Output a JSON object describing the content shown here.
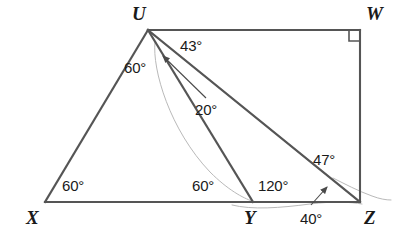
{
  "figure": {
    "kind": "geometry-diagram",
    "stroke_color": "#555555",
    "faint_stroke_color": "#b9b9b9",
    "leader_color": "#4a4a4a",
    "text_color": "#1a1a1a",
    "background": "#ffffff",
    "width": 405,
    "height": 235
  },
  "vertices": [
    {
      "id": "U",
      "label": "U",
      "x": 148,
      "y": 30,
      "label_x": 132,
      "label_y": 4
    },
    {
      "id": "W",
      "label": "W",
      "x": 360,
      "y": 30,
      "label_x": 366,
      "label_y": 4
    },
    {
      "id": "X",
      "label": "X",
      "x": 45,
      "y": 202,
      "label_x": 26,
      "label_y": 208
    },
    {
      "id": "Y",
      "label": "Y",
      "x": 253,
      "y": 202,
      "label_x": 244,
      "label_y": 208
    },
    {
      "id": "Z",
      "label": "Z",
      "x": 360,
      "y": 202,
      "label_x": 364,
      "label_y": 208
    }
  ],
  "segments": [
    {
      "name": "segment-UW",
      "from": "U",
      "to": "W",
      "x1": 148,
      "y1": 30,
      "x2": 360,
      "y2": 30
    },
    {
      "name": "segment-WZ",
      "from": "W",
      "to": "Z",
      "x1": 360,
      "y1": 30,
      "x2": 360,
      "y2": 202
    },
    {
      "name": "segment-XZ",
      "from": "X",
      "to": "Z",
      "x1": 45,
      "y1": 202,
      "x2": 360,
      "y2": 202
    },
    {
      "name": "segment-UX",
      "from": "U",
      "to": "X",
      "x1": 148,
      "y1": 30,
      "x2": 45,
      "y2": 202
    },
    {
      "name": "segment-UY",
      "from": "U",
      "to": "Y",
      "x1": 148,
      "y1": 30,
      "x2": 253,
      "y2": 202
    },
    {
      "name": "segment-UZ",
      "from": "U",
      "to": "Z",
      "x1": 148,
      "y1": 30,
      "x2": 360,
      "y2": 202
    }
  ],
  "right_angle_marker": {
    "name": "right-angle-marker-W",
    "at_vertex": "W",
    "size": 11
  },
  "angles": [
    {
      "name": "angle-label-60-at-U",
      "value": "60°",
      "x": 124,
      "y": 60,
      "vertex": "U"
    },
    {
      "name": "angle-label-43-at-U",
      "value": "43°",
      "x": 180,
      "y": 38,
      "vertex": "U"
    },
    {
      "name": "angle-label-20-at-U",
      "value": "20°",
      "x": 195,
      "y": 102,
      "vertex": "U"
    },
    {
      "name": "angle-label-60-at-X",
      "value": "60°",
      "x": 62,
      "y": 178,
      "vertex": "X"
    },
    {
      "name": "angle-label-60-at-Y",
      "value": "60°",
      "x": 192,
      "y": 178,
      "vertex": "Y"
    },
    {
      "name": "angle-label-120-at-Y",
      "value": "120°",
      "x": 258,
      "y": 178,
      "vertex": "Y"
    },
    {
      "name": "angle-label-47-at-Z",
      "value": "47°",
      "x": 313,
      "y": 152,
      "vertex": "Z"
    },
    {
      "name": "angle-label-40-at-Z",
      "value": "40°",
      "x": 300,
      "y": 211,
      "vertex": "Z"
    }
  ],
  "leaders": [
    {
      "name": "leader-arrow-20",
      "for_label": "20°",
      "x1": 206,
      "y1": 98,
      "x2": 163,
      "y2": 56
    },
    {
      "name": "leader-arrow-40",
      "for_label": "40°",
      "x1": 311,
      "y1": 205,
      "x2": 327,
      "y2": 187
    }
  ],
  "faint_marks": [
    {
      "name": "faint-mark-through-U-Y",
      "d": "M 155 42 C 152 70, 170 130, 210 172 C 228 190, 243 198, 252 201"
    },
    {
      "name": "faint-mark-along-base",
      "d": "M 232 205 C 252 210, 280 208, 310 204 C 334 201, 350 202, 362 204"
    },
    {
      "name": "faint-mark-past-Z",
      "d": "M 333 178 C 345 184, 358 191, 372 196 C 380 199, 386 200, 391 200"
    }
  ]
}
